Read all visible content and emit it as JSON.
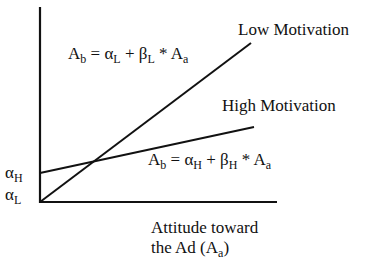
{
  "diagram": {
    "axes": {
      "x_label_line1": "Attitude toward",
      "x_label_line2_prefix": "the Ad (A",
      "x_label_line2_sub": "a",
      "x_label_line2_suffix": ")"
    },
    "y_ticks": [
      {
        "symbol": "α",
        "sub": "H"
      },
      {
        "symbol": "α",
        "sub": "L"
      }
    ],
    "lines": [
      {
        "name": "Low Motivation",
        "equation": {
          "lhs": "A",
          "lhs_sub": "b",
          "eq": " = ",
          "a": "α",
          "a_sub": "L",
          "plus": " + ",
          "b": "β",
          "b_sub": "L",
          "times": " * ",
          "x": "A",
          "x_sub": "a"
        }
      },
      {
        "name": "High Motivation",
        "equation": {
          "lhs": "A",
          "lhs_sub": "b",
          "eq": " = ",
          "a": "α",
          "a_sub": "H",
          "plus": " + ",
          "b": "β",
          "b_sub": "H",
          "times": " * ",
          "x": "A",
          "x_sub": "a"
        }
      }
    ],
    "colors": {
      "ink": "#111111",
      "background": "#ffffff"
    }
  }
}
